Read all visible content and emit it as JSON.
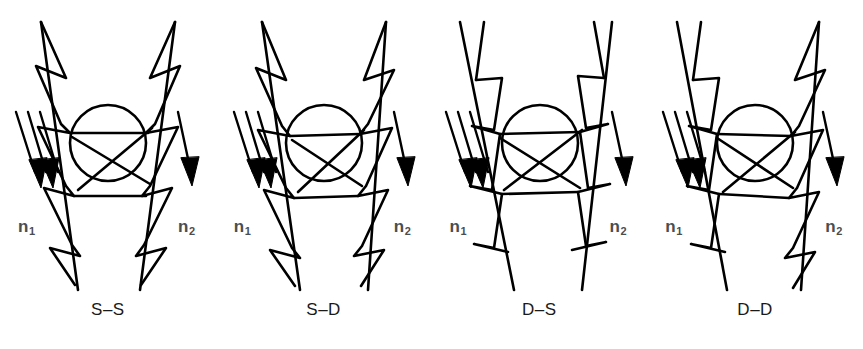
{
  "figure": {
    "background_color": "#ffffff",
    "ink_color": "#000000",
    "label_color": "#4d4d4d",
    "caption_color": "#1a1a1a",
    "width": 863,
    "height": 349,
    "panel_count": 4
  },
  "common": {
    "left_index_label": "n",
    "left_index_subscript": "1",
    "right_index_label": "n",
    "right_index_subscript": "2",
    "incoming_ray_count": 3,
    "outgoing_ray_count": 1,
    "element_shape": "circle",
    "wall_shape": "serrated-zigzag"
  },
  "panels": [
    {
      "id": "panel-ss",
      "caption": "S–S",
      "left_code": "S",
      "right_code": "D",
      "left_index": "n",
      "left_sub": "1",
      "right_index": "n",
      "right_sub": "2"
    },
    {
      "id": "panel-sd",
      "caption": "S–D",
      "left_code": "S",
      "right_code": "D",
      "left_index": "n",
      "left_sub": "1",
      "right_index": "n",
      "right_sub": "2"
    },
    {
      "id": "panel-ds",
      "caption": "D–S",
      "left_code": "D",
      "right_code": "S",
      "left_index": "n",
      "left_sub": "1",
      "right_index": "n",
      "right_sub": "2"
    },
    {
      "id": "panel-dd",
      "caption": "D–D",
      "left_code": "D",
      "right_code": "D",
      "left_index": "n",
      "left_sub": "1",
      "right_index": "n",
      "right_sub": "2"
    }
  ]
}
